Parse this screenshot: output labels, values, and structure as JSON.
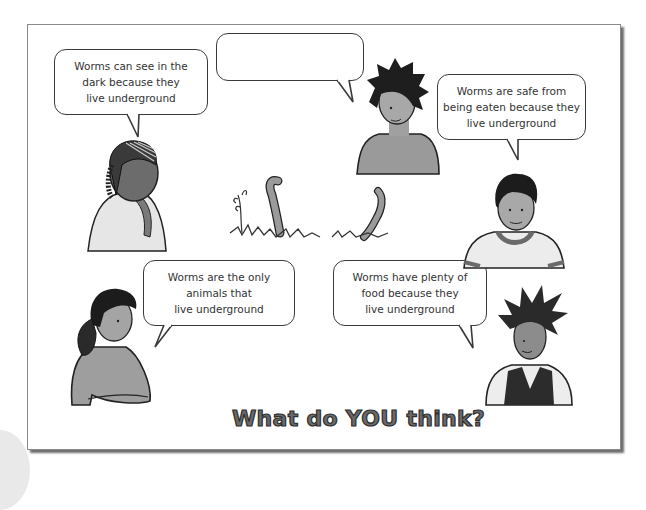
{
  "poster": {
    "title": "What do YOU think?",
    "bubbles": [
      {
        "id": "dark",
        "lines": [
          "Worms can see in the",
          "dark because they",
          "live underground"
        ]
      },
      {
        "id": "blank",
        "lines": []
      },
      {
        "id": "safe",
        "lines": [
          "Worms are safe from",
          "being eaten because they",
          "live underground"
        ]
      },
      {
        "id": "only",
        "lines": [
          "Worms are the only",
          "animals that",
          "live underground"
        ]
      },
      {
        "id": "food",
        "lines": [
          "Worms have plenty of",
          "food because they",
          "live underground"
        ]
      }
    ],
    "characters": [
      {
        "name": "girl-braids",
        "description": "girl with braided hair, facing away"
      },
      {
        "name": "boy-spiky-hair",
        "description": "spiky-haired child in grey top"
      },
      {
        "name": "boy-ringer-tee",
        "description": "boy in ringer t-shirt"
      },
      {
        "name": "girl-ponytail",
        "description": "girl with ponytail in grey top"
      },
      {
        "name": "teen-waistcoat",
        "description": "spiky-haired teen in waistcoat"
      }
    ],
    "center_illustration": "two worms emerging from grass"
  },
  "colors": {
    "outline": "#3a3a3a",
    "skin_grey": "#9a9a9a",
    "cloth_grey": "#a8a8a8",
    "title_fill": "#6a6a6a"
  }
}
